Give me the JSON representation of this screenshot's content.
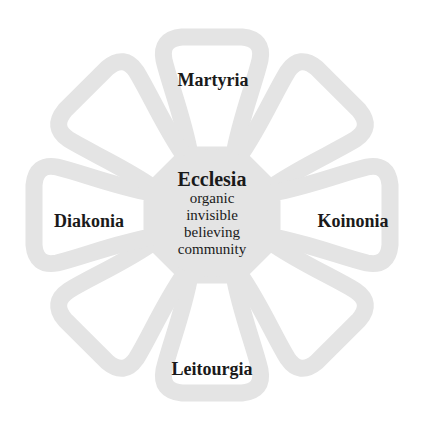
{
  "diagram": {
    "type": "flower",
    "colors": {
      "petal_stroke": "#e4e4e4",
      "center_fill": "#e4e4e4",
      "text": "#1a1a1a",
      "background": "#ffffff"
    },
    "center": {
      "title": "Ecclesia",
      "lines": [
        "organic",
        "invisible",
        "believing",
        "community"
      ]
    },
    "petals": [
      {
        "position": "top",
        "label": "Martyria"
      },
      {
        "position": "top-right",
        "label": ""
      },
      {
        "position": "right",
        "label": "Koinonia"
      },
      {
        "position": "bottom-right",
        "label": ""
      },
      {
        "position": "bottom",
        "label": "Leitourgia"
      },
      {
        "position": "bottom-left",
        "label": ""
      },
      {
        "position": "left",
        "label": "Diakonia"
      },
      {
        "position": "top-left",
        "label": ""
      }
    ]
  }
}
